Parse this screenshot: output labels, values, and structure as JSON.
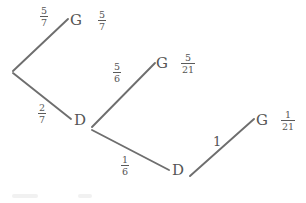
{
  "diagram": {
    "type": "probability-tree",
    "stroke_color": "#6e6e6e",
    "text_color": "#555555",
    "background_color": "#ffffff",
    "nodes": [
      {
        "id": "root",
        "label": "",
        "x": 12,
        "y": 72
      },
      {
        "id": "g1",
        "label": "G",
        "x": 76,
        "y": 22
      },
      {
        "id": "d1",
        "label": "D",
        "x": 80,
        "y": 122
      },
      {
        "id": "g2",
        "label": "G",
        "x": 162,
        "y": 65
      },
      {
        "id": "d2",
        "label": "D",
        "x": 178,
        "y": 172
      },
      {
        "id": "g3",
        "label": "G",
        "x": 262,
        "y": 122
      }
    ],
    "branch_labels": [
      {
        "id": "b-root-g1",
        "numerator": "5",
        "denominator": "7",
        "x": 40,
        "y": 6
      },
      {
        "id": "b-root-d1",
        "numerator": "2",
        "denominator": "7",
        "x": 38,
        "y": 103
      },
      {
        "id": "b-d1-g2",
        "numerator": "5",
        "denominator": "6",
        "x": 113,
        "y": 62
      },
      {
        "id": "b-d1-d2",
        "numerator": "1",
        "denominator": "6",
        "x": 121,
        "y": 155
      },
      {
        "id": "b-d2-g3",
        "whole": "1",
        "x": 213,
        "y": 135
      }
    ],
    "outcome_labels": [
      {
        "id": "o-g1",
        "numerator": "5",
        "denominator": "7",
        "x": 98,
        "y": 10
      },
      {
        "id": "o-g2",
        "numerator": "5",
        "denominator": "21",
        "x": 181,
        "y": 53
      },
      {
        "id": "o-g3",
        "numerator": "1",
        "denominator": "21",
        "x": 281,
        "y": 110
      }
    ],
    "edges": [
      {
        "id": "edge-root-g1",
        "from": "root",
        "to": "g1",
        "x1": 13,
        "y1": 71,
        "x2": 68,
        "y2": 19
      },
      {
        "id": "edge-root-d1",
        "from": "root",
        "to": "d1",
        "x1": 13,
        "y1": 73,
        "x2": 71,
        "y2": 119
      },
      {
        "id": "edge-d1-g2",
        "from": "d1",
        "to": "g2",
        "x1": 92,
        "y1": 127,
        "x2": 155,
        "y2": 63
      },
      {
        "id": "edge-d1-d2",
        "from": "d1",
        "to": "d2",
        "x1": 92,
        "y1": 130,
        "x2": 169,
        "y2": 170
      },
      {
        "id": "edge-d2-g3",
        "from": "d2",
        "to": "g3",
        "x1": 190,
        "y1": 176,
        "x2": 254,
        "y2": 119
      }
    ]
  }
}
